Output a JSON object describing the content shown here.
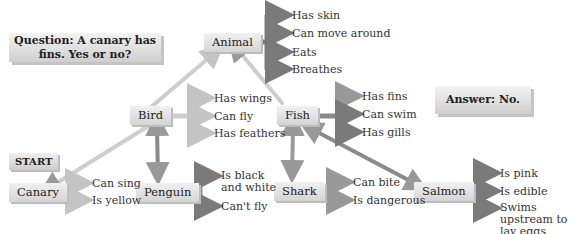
{
  "question": "Question: A canary has fins. Yes or no?",
  "answer": "Answer: No.",
  "start_label": "START",
  "nodes": {
    "animal": {
      "label": "Animal",
      "properties": [
        "Has skin",
        "Can move around",
        "Eats",
        "Breathes"
      ]
    },
    "bird": {
      "label": "Bird",
      "properties": [
        "Has wings",
        "Can fly",
        "Has feathers"
      ]
    },
    "fish": {
      "label": "Fish",
      "properties": [
        "Has fins",
        "Can swim",
        "Has gills"
      ]
    },
    "canary": {
      "label": "Canary",
      "properties": [
        "Can sing",
        "Is yellow"
      ]
    },
    "penguin": {
      "label": "Penguin",
      "properties": [
        "Is black and white",
        "Can't fly"
      ]
    },
    "shark": {
      "label": "Shark",
      "properties": [
        "Can bite",
        "Is dangerous"
      ]
    },
    "salmon": {
      "label": "Salmon",
      "properties": [
        "Is pink",
        "Is edible",
        "Swims upstream to lay eggs"
      ]
    }
  },
  "edges": [
    {
      "from": "Bird",
      "to": "Animal"
    },
    {
      "from": "Fish",
      "to": "Animal"
    },
    {
      "from": "Canary",
      "to": "Bird"
    },
    {
      "from": "Penguin",
      "to": "Bird"
    },
    {
      "from": "Shark",
      "to": "Fish"
    },
    {
      "from": "Salmon",
      "to": "Fish"
    }
  ],
  "colors": {
    "light_arrow": "#c8c8c8",
    "dark_arrow": "#7a7a7a",
    "box": "#dcdcdc"
  }
}
